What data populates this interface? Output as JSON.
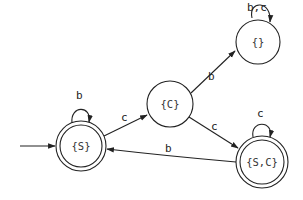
{
  "diagram": {
    "type": "state-machine (DFA)",
    "colors": {
      "stroke": "#222222",
      "background": "#ffffff"
    },
    "states": [
      {
        "id": "S",
        "label": "{S}",
        "accepting": true,
        "initial": true,
        "cx": 81,
        "cy": 146
      },
      {
        "id": "C",
        "label": "{C}",
        "accepting": false,
        "initial": false,
        "cx": 170,
        "cy": 104
      },
      {
        "id": "E",
        "label": "{}",
        "accepting": false,
        "initial": false,
        "cx": 255,
        "cy": 40
      },
      {
        "id": "SC",
        "label": "{S,C}",
        "accepting": true,
        "initial": false,
        "cx": 262,
        "cy": 162
      }
    ],
    "transitions": [
      {
        "from": "S",
        "to": "S",
        "label": "b"
      },
      {
        "from": "S",
        "to": "C",
        "label": "c"
      },
      {
        "from": "C",
        "to": "E",
        "label": "b"
      },
      {
        "from": "C",
        "to": "SC",
        "label": "c"
      },
      {
        "from": "E",
        "to": "E",
        "label": "b,c"
      },
      {
        "from": "SC",
        "to": "SC",
        "label": "c"
      },
      {
        "from": "SC",
        "to": "S",
        "label": "b"
      }
    ]
  }
}
